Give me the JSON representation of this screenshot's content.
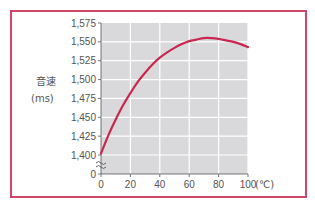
{
  "chart_data": {
    "type": "line",
    "title": "",
    "xlabel": "(℃)",
    "ylabel": "音速",
    "ylabel_unit": "(ms)",
    "xlim": [
      0,
      100
    ],
    "ylim": [
      1400,
      1575
    ],
    "y_axis_break": true,
    "y_break_zero_label": "0",
    "grid": true,
    "x_ticks": [
      0,
      20,
      40,
      60,
      80,
      100
    ],
    "x_tick_labels": [
      "0",
      "20",
      "40",
      "60",
      "80",
      "100"
    ],
    "y_ticks": [
      1400,
      1425,
      1450,
      1475,
      1500,
      1525,
      1550,
      1575
    ],
    "y_tick_labels": [
      "1,400",
      "1,425",
      "1,450",
      "1,475",
      "1,500",
      "1,525",
      "1,550",
      "1,575"
    ],
    "series": [
      {
        "name": "音速",
        "color": "#c8284f",
        "x": [
          0,
          5,
          10,
          15,
          20,
          25,
          30,
          35,
          40,
          45,
          50,
          55,
          60,
          65,
          70,
          75,
          80,
          85,
          90,
          95,
          100
        ],
        "y": [
          1402,
          1426,
          1447,
          1466,
          1482,
          1497,
          1509,
          1520,
          1529,
          1536,
          1542,
          1547,
          1551,
          1553,
          1555,
          1555,
          1554,
          1552,
          1550,
          1547,
          1543
        ]
      }
    ]
  },
  "colors": {
    "frame": "#d2456a",
    "plot_background": "#d9d9db",
    "grid": "#ffffff",
    "axis": "#555555"
  }
}
